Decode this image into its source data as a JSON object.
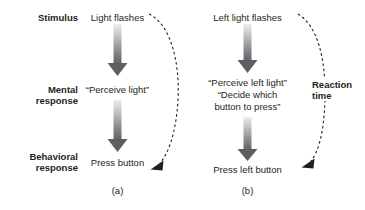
{
  "figure": {
    "type": "flow-diagram",
    "row_labels": [
      {
        "id": "stimulus",
        "text": "Stimulus"
      },
      {
        "id": "mental-response",
        "text": "Mental\nresponse"
      },
      {
        "id": "behavioral-response",
        "text": "Behavioral\nresponse"
      }
    ],
    "panels": [
      {
        "id": "a",
        "caption": "(a)",
        "nodes": [
          {
            "id": "stimulus",
            "text": "Light flashes"
          },
          {
            "id": "mental",
            "text": "“Perceive light”"
          },
          {
            "id": "behavioral",
            "text": "Press button"
          }
        ]
      },
      {
        "id": "b",
        "caption": "(b)",
        "nodes": [
          {
            "id": "stimulus",
            "text": "Left light flashes"
          },
          {
            "id": "mental",
            "text": "“Perceive left light”\n“Decide which\nbutton to press”"
          },
          {
            "id": "behavioral",
            "text": "Press left button"
          }
        ]
      }
    ],
    "annotations": [
      {
        "id": "reaction-time",
        "text": "Reaction\ntime"
      }
    ],
    "colors": {
      "text": "#231f20",
      "arrow_dark": "#58595b",
      "arrow_light": "#e8e8e9",
      "dashed_stroke": "#231f20",
      "background": "#ffffff"
    }
  }
}
